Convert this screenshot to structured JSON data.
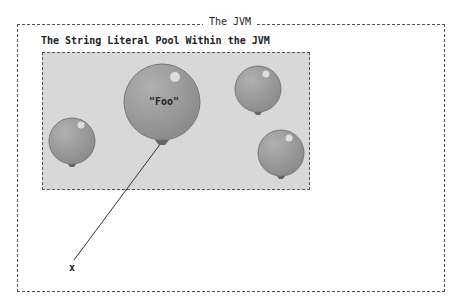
{
  "diagram": {
    "outer_title": "The JVM",
    "pool_title": "The String Literal Pool Within the JVM",
    "balloons": [
      {
        "id": "foo",
        "label": "\"Foo\"",
        "cx": 162,
        "cy": 102,
        "r": 38
      },
      {
        "id": "b2",
        "label": "",
        "cx": 72,
        "cy": 141,
        "r": 23
      },
      {
        "id": "b3",
        "label": "",
        "cx": 258,
        "cy": 89,
        "r": 23
      },
      {
        "id": "b4",
        "label": "",
        "cx": 281,
        "cy": 153,
        "r": 23
      }
    ],
    "reference_variable": "x",
    "colors": {
      "balloon_fill": "#9a9a9a",
      "pool_fill": "#d8d8d8",
      "border": "#555555"
    }
  }
}
